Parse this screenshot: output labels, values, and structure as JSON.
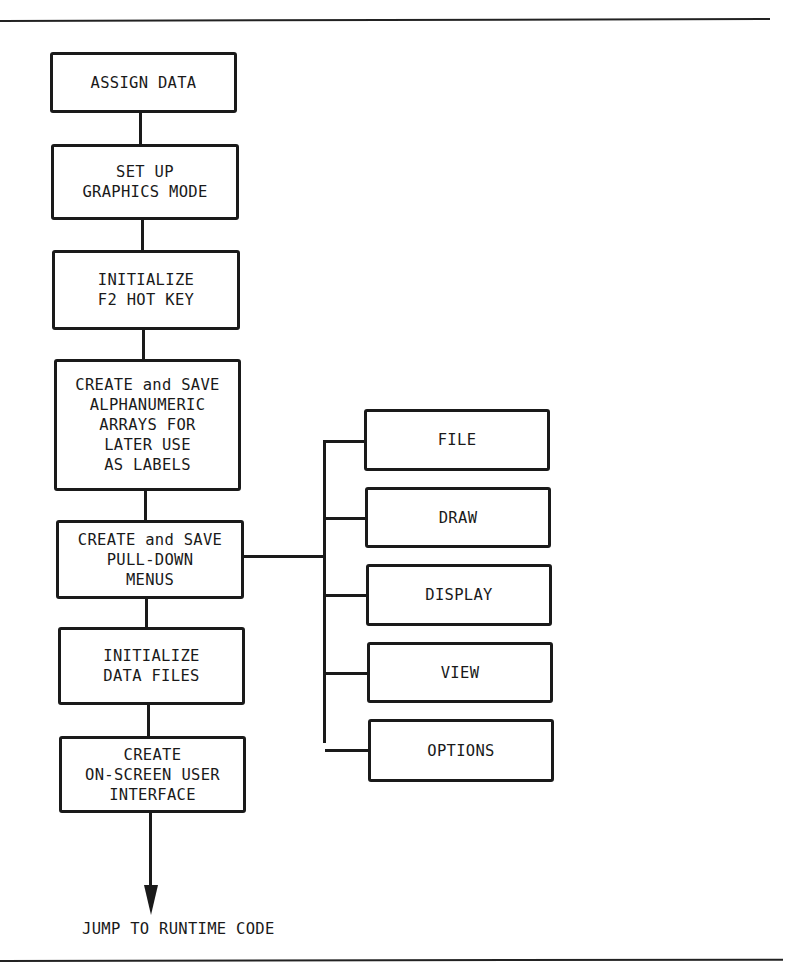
{
  "diagram": {
    "type": "flowchart",
    "main_flow": [
      {
        "id": "assign-data",
        "lines": [
          "ASSIGN DATA"
        ]
      },
      {
        "id": "set-up-graphics-mode",
        "lines": [
          "SET UP",
          "GRAPHICS MODE"
        ]
      },
      {
        "id": "initialize-f2-hot-key",
        "lines": [
          "INITIALIZE",
          "F2 HOT KEY"
        ]
      },
      {
        "id": "create-save-alphanumeric-arrays",
        "lines": [
          "CREATE and SAVE",
          "ALPHANUMERIC",
          "ARRAYS FOR",
          "LATER USE",
          "AS LABELS"
        ]
      },
      {
        "id": "create-save-pull-down-menus",
        "lines": [
          "CREATE and SAVE",
          "PULL-DOWN",
          "MENUS"
        ]
      },
      {
        "id": "initialize-data-files",
        "lines": [
          "INITIALIZE",
          "DATA FILES"
        ]
      },
      {
        "id": "create-on-screen-user-interface",
        "lines": [
          "CREATE",
          "ON-SCREEN USER",
          "INTERFACE"
        ]
      }
    ],
    "menus_branch": {
      "parent": "create-save-pull-down-menus",
      "items": [
        {
          "label": "FILE"
        },
        {
          "label": "DRAW"
        },
        {
          "label": "DISPLAY"
        },
        {
          "label": "VIEW"
        },
        {
          "label": "OPTIONS"
        }
      ]
    },
    "terminal": {
      "label": "JUMP TO RUNTIME CODE"
    },
    "edges": [
      [
        "assign-data",
        "set-up-graphics-mode"
      ],
      [
        "set-up-graphics-mode",
        "initialize-f2-hot-key"
      ],
      [
        "initialize-f2-hot-key",
        "create-save-alphanumeric-arrays"
      ],
      [
        "create-save-alphanumeric-arrays",
        "create-save-pull-down-menus"
      ],
      [
        "create-save-pull-down-menus",
        "initialize-data-files"
      ],
      [
        "initialize-data-files",
        "create-on-screen-user-interface"
      ],
      [
        "create-on-screen-user-interface",
        "jump-to-runtime-code"
      ],
      [
        "create-save-pull-down-menus",
        "FILE"
      ],
      [
        "create-save-pull-down-menus",
        "DRAW"
      ],
      [
        "create-save-pull-down-menus",
        "DISPLAY"
      ],
      [
        "create-save-pull-down-menus",
        "VIEW"
      ],
      [
        "create-save-pull-down-menus",
        "OPTIONS"
      ]
    ]
  }
}
